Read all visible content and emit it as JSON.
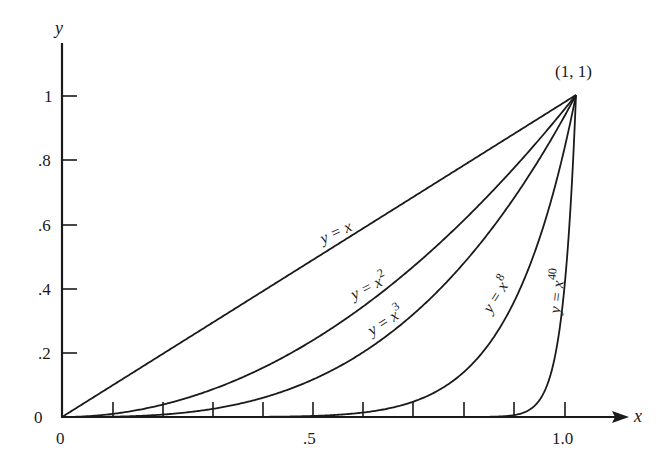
{
  "chart_data": {
    "type": "line",
    "title": "",
    "xlabel": "x",
    "ylabel": "y",
    "xlim": [
      0,
      1.1
    ],
    "ylim": [
      0,
      1.15
    ],
    "grid": false,
    "legend": "none (curves labeled inline)",
    "x_ticks": [
      0.1,
      0.2,
      0.3,
      0.4,
      0.5,
      0.6,
      0.7,
      0.8,
      0.9,
      1.0
    ],
    "x_tick_labels": [
      {
        "value": 0,
        "label": "0"
      },
      {
        "value": 0.5,
        "label": ".5"
      },
      {
        "value": 1.0,
        "label": "1.0"
      }
    ],
    "y_ticks": [
      0,
      0.2,
      0.4,
      0.6,
      0.8,
      1.0
    ],
    "y_tick_labels": [
      "0",
      ".2",
      ".4",
      ".6",
      ".8",
      "1"
    ],
    "series": [
      {
        "name": "y = x",
        "exponent": 1,
        "label_base": "y = x",
        "label_sup": ""
      },
      {
        "name": "y = x^2",
        "exponent": 2,
        "label_base": "y = x",
        "label_sup": "2"
      },
      {
        "name": "y = x^3",
        "exponent": 3,
        "label_base": "y = x",
        "label_sup": "3"
      },
      {
        "name": "y = x^8",
        "exponent": 8,
        "label_base": "y = x",
        "label_sup": "8"
      },
      {
        "name": "y = x^40",
        "exponent": 40,
        "label_base": "y = x",
        "label_sup": "40"
      }
    ],
    "annotations": [
      {
        "text": "(1, 1)",
        "x": 1,
        "y": 1
      }
    ]
  },
  "labels": {
    "x_axis": "x",
    "y_axis": "y",
    "origin_x": "0",
    "point": "(1, 1)",
    "x_half": ".5",
    "x_one": "1.0",
    "y_ticks": [
      "0",
      ".2",
      ".4",
      ".6",
      ".8",
      "1"
    ],
    "curves": {
      "c1": {
        "base": "y = x",
        "sup": ""
      },
      "c2": {
        "base": "y = x",
        "sup": "2"
      },
      "c3": {
        "base": "y = x",
        "sup": "3"
      },
      "c8": {
        "base": "y = x",
        "sup": "8"
      },
      "c40": {
        "base": "y = x",
        "sup": "40"
      }
    }
  }
}
